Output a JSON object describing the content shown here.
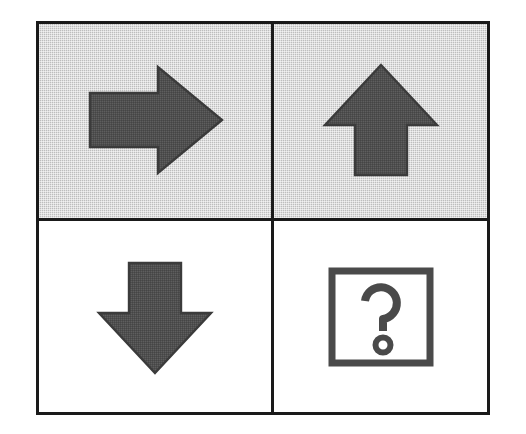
{
  "figure": {
    "layout": {
      "rows": 2,
      "columns": 2,
      "border_color": "#1a1a1a",
      "page_background": "#ffffff"
    },
    "cells": [
      {
        "position": "top-left",
        "icon_name": "arrow-right-icon",
        "icon_label": "Right arrow",
        "direction": "right",
        "background": "gray",
        "background_color": "#c9c9c9",
        "glyph_color": "#4f4f4f",
        "style": "solid filled block arrow"
      },
      {
        "position": "top-right",
        "icon_name": "arrow-up-icon",
        "icon_label": "Up arrow",
        "direction": "up",
        "background": "gray",
        "background_color": "#c9c9c9",
        "glyph_color": "#4f4f4f",
        "style": "solid filled block arrow"
      },
      {
        "position": "bottom-left",
        "icon_name": "arrow-down-icon",
        "icon_label": "Down arrow",
        "direction": "down",
        "background": "white",
        "background_color": "#ffffff",
        "glyph_color": "#4f4f4f",
        "style": "solid filled block arrow"
      },
      {
        "position": "bottom-right",
        "icon_name": "question-mark-box-icon",
        "icon_label": "Question mark in square",
        "direction": "unknown",
        "background": "white",
        "background_color": "#ffffff",
        "glyph_color": "#4a4a4a",
        "style": "outlined question mark inside square outline",
        "symbol": "?"
      }
    ]
  }
}
